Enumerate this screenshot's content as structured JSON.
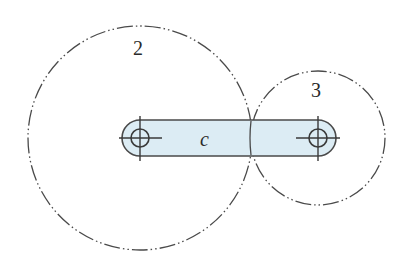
{
  "diagram": {
    "type": "planetary-gear-train-schematic",
    "labels": {
      "gear_sun": "2",
      "gear_planet": "3",
      "arm": "c"
    },
    "colors": {
      "arm_fill": "#dcecf4",
      "line": "#4a4a4a",
      "background": "#ffffff"
    },
    "gears": [
      {
        "id": "2",
        "cx": 140,
        "cy": 138,
        "r": 112
      },
      {
        "id": "3",
        "cx": 318,
        "cy": 138,
        "r": 67
      }
    ],
    "arm": {
      "x1": 140,
      "x2": 318,
      "cy": 138,
      "half_width": 18
    },
    "pivots": [
      {
        "cx": 140,
        "cy": 138,
        "r": 9
      },
      {
        "cx": 318,
        "cy": 138,
        "r": 9
      }
    ]
  }
}
